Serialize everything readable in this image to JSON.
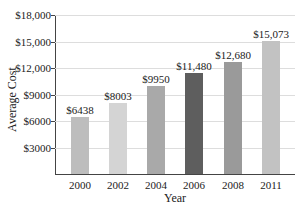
{
  "chart_data": {
    "type": "bar",
    "title": "",
    "xlabel": "Year",
    "ylabel": "Average Cost",
    "categories": [
      "2000",
      "2002",
      "2004",
      "2006",
      "2008",
      "2011"
    ],
    "values": [
      6438,
      8003,
      9950,
      11480,
      12680,
      15073
    ],
    "value_labels": [
      "$6438",
      "$8003",
      "$9950",
      "$11,480",
      "$12,680",
      "$15,073"
    ],
    "bar_colors": [
      "#bdbdbd",
      "#d4d4d4",
      "#a9a9a9",
      "#5e5e5e",
      "#9a9a9a",
      "#c2c2c2"
    ],
    "ylim": [
      0,
      18000
    ],
    "yticks": [
      3000,
      6000,
      9000,
      12000,
      15000,
      18000
    ],
    "ytick_labels": [
      "$3000",
      "$6000",
      "$9000",
      "$12,000",
      "$15,000",
      "$18,000"
    ],
    "grid": true,
    "legend": null
  }
}
